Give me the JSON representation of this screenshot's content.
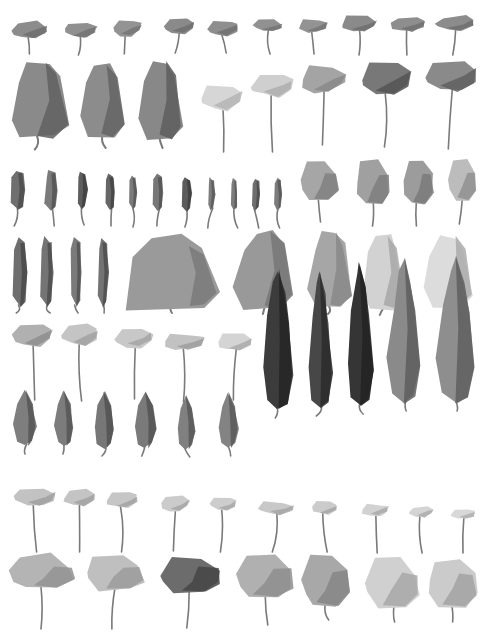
{
  "title": "",
  "background": "#ffffff",
  "trunk_color": "#7a7a7a",
  "rows": [
    {
      "name": "row-1-small-flat-canopy",
      "kind": "flat",
      "trees": [
        {
          "x": 30,
          "y": 30,
          "w": 34,
          "h": 16,
          "trunk": 16,
          "fill": "#8c8c8c",
          "shade": "#6f6f6f"
        },
        {
          "x": 80,
          "y": 30,
          "w": 32,
          "h": 14,
          "trunk": 18,
          "fill": "#909090",
          "shade": "#737373"
        },
        {
          "x": 127,
          "y": 28,
          "w": 28,
          "h": 16,
          "trunk": 18,
          "fill": "#939393",
          "shade": "#767676"
        },
        {
          "x": 179,
          "y": 26,
          "w": 30,
          "h": 14,
          "trunk": 20,
          "fill": "#8a8a8a",
          "shade": "#6e6e6e"
        },
        {
          "x": 223,
          "y": 28,
          "w": 30,
          "h": 14,
          "trunk": 18,
          "fill": "#8e8e8e",
          "shade": "#707070"
        },
        {
          "x": 268,
          "y": 26,
          "w": 28,
          "h": 12,
          "trunk": 22,
          "fill": "#919191",
          "shade": "#747474"
        },
        {
          "x": 313,
          "y": 26,
          "w": 28,
          "h": 12,
          "trunk": 22,
          "fill": "#939393",
          "shade": "#767676"
        },
        {
          "x": 359,
          "y": 24,
          "w": 34,
          "h": 14,
          "trunk": 24,
          "fill": "#8a8a8a",
          "shade": "#6d6d6d"
        },
        {
          "x": 408,
          "y": 24,
          "w": 34,
          "h": 14,
          "trunk": 24,
          "fill": "#8e8e8e",
          "shade": "#717171"
        },
        {
          "x": 455,
          "y": 24,
          "w": 38,
          "h": 14,
          "trunk": 24,
          "fill": "#8c8c8c",
          "shade": "#6f6f6f"
        }
      ]
    },
    {
      "name": "row-2-mixed",
      "kind": "mixed",
      "trees": [
        {
          "x": 38,
          "y": 100,
          "w": 58,
          "h": 75,
          "trunk": 12,
          "fill": "#8a8a8a",
          "shade": "#606060",
          "shape": "column"
        },
        {
          "x": 102,
          "y": 100,
          "w": 46,
          "h": 72,
          "trunk": 12,
          "fill": "#8c8c8c",
          "shade": "#646464",
          "shape": "column"
        },
        {
          "x": 160,
          "y": 100,
          "w": 44,
          "h": 76,
          "trunk": 10,
          "fill": "#888888",
          "shade": "#5e5e5e",
          "shape": "column"
        },
        {
          "x": 222,
          "y": 98,
          "w": 40,
          "h": 24,
          "trunk": 42,
          "fill": "#d6d6d6",
          "shade": "#b5b5b5",
          "shape": "flat"
        },
        {
          "x": 272,
          "y": 86,
          "w": 40,
          "h": 20,
          "trunk": 56,
          "fill": "#cfcfcf",
          "shade": "#aeaeae",
          "shape": "flat"
        },
        {
          "x": 323,
          "y": 80,
          "w": 44,
          "h": 26,
          "trunk": 52,
          "fill": "#a4a4a4",
          "shade": "#8a8a8a",
          "shape": "flat"
        },
        {
          "x": 386,
          "y": 80,
          "w": 50,
          "h": 30,
          "trunk": 52,
          "fill": "#787878",
          "shade": "#545454",
          "shape": "flat"
        },
        {
          "x": 451,
          "y": 76,
          "w": 52,
          "h": 30,
          "trunk": 58,
          "fill": "#8a8a8a",
          "shade": "#5f5f5f",
          "shape": "flat"
        }
      ]
    },
    {
      "name": "row-3-narrow-and-round",
      "kind": "mixed",
      "trees": [
        {
          "x": 18,
          "y": 190,
          "w": 14,
          "h": 40,
          "trunk": 16,
          "fill": "#6f6f6f",
          "shade": "#4e4e4e",
          "shape": "narrow"
        },
        {
          "x": 51,
          "y": 190,
          "w": 12,
          "h": 40,
          "trunk": 16,
          "fill": "#7b7b7b",
          "shade": "#555555",
          "shape": "narrow"
        },
        {
          "x": 82,
          "y": 190,
          "w": 10,
          "h": 38,
          "trunk": 16,
          "fill": "#5e5e5e",
          "shade": "#414141",
          "shape": "narrow"
        },
        {
          "x": 110,
          "y": 192,
          "w": 10,
          "h": 36,
          "trunk": 16,
          "fill": "#666666",
          "shade": "#444444",
          "shape": "narrow"
        },
        {
          "x": 133,
          "y": 192,
          "w": 8,
          "h": 34,
          "trunk": 18,
          "fill": "#7a7a7a",
          "shade": "#565656",
          "shape": "narrow"
        },
        {
          "x": 158,
          "y": 192,
          "w": 10,
          "h": 36,
          "trunk": 16,
          "fill": "#777777",
          "shade": "#545454",
          "shape": "narrow"
        },
        {
          "x": 187,
          "y": 194,
          "w": 9,
          "h": 34,
          "trunk": 16,
          "fill": "#5c5c5c",
          "shade": "#3e3e3e",
          "shape": "narrow"
        },
        {
          "x": 211,
          "y": 194,
          "w": 7,
          "h": 32,
          "trunk": 18,
          "fill": "#7e7e7e",
          "shade": "#5a5a5a",
          "shape": "narrow"
        },
        {
          "x": 234,
          "y": 194,
          "w": 7,
          "h": 32,
          "trunk": 18,
          "fill": "#7d7d7d",
          "shade": "#595959",
          "shape": "narrow"
        },
        {
          "x": 256,
          "y": 194,
          "w": 8,
          "h": 32,
          "trunk": 18,
          "fill": "#6e6e6e",
          "shade": "#4b4b4b",
          "shape": "narrow"
        },
        {
          "x": 278,
          "y": 194,
          "w": 7,
          "h": 32,
          "trunk": 18,
          "fill": "#7c7c7c",
          "shade": "#585858",
          "shape": "narrow"
        },
        {
          "x": 320,
          "y": 180,
          "w": 36,
          "h": 40,
          "trunk": 22,
          "fill": "#a6a6a6",
          "shade": "#808080",
          "shape": "round"
        },
        {
          "x": 373,
          "y": 182,
          "w": 34,
          "h": 44,
          "trunk": 22,
          "fill": "#a0a0a0",
          "shade": "#7e7e7e",
          "shape": "round"
        },
        {
          "x": 418,
          "y": 182,
          "w": 30,
          "h": 44,
          "trunk": 22,
          "fill": "#9c9c9c",
          "shade": "#7a7a7a",
          "shape": "round"
        },
        {
          "x": 462,
          "y": 180,
          "w": 28,
          "h": 40,
          "trunk": 24,
          "fill": "#bcbcbc",
          "shade": "#909090",
          "shape": "round"
        }
      ]
    },
    {
      "name": "row-4-tall-narrow-and-large",
      "kind": "mixed",
      "trees": [
        {
          "x": 20,
          "y": 272,
          "w": 14,
          "h": 70,
          "trunk": 6,
          "fill": "#6e6e6e",
          "shade": "#4a4a4a",
          "shape": "narrow"
        },
        {
          "x": 47,
          "y": 272,
          "w": 12,
          "h": 70,
          "trunk": 6,
          "fill": "#747474",
          "shade": "#4e4e4e",
          "shape": "narrow"
        },
        {
          "x": 76,
          "y": 272,
          "w": 11,
          "h": 70,
          "trunk": 6,
          "fill": "#7a7a7a",
          "shade": "#525252",
          "shape": "narrow"
        },
        {
          "x": 103,
          "y": 272,
          "w": 11,
          "h": 70,
          "trunk": 6,
          "fill": "#737373",
          "shade": "#4d4d4d",
          "shape": "narrow"
        },
        {
          "x": 172,
          "y": 270,
          "w": 92,
          "h": 74,
          "trunk": 6,
          "fill": "#9a9a9a",
          "shade": "#7a7a7a",
          "shape": "mound"
        },
        {
          "x": 264,
          "y": 270,
          "w": 60,
          "h": 76,
          "trunk": 6,
          "fill": "#999999",
          "shade": "#777777",
          "shape": "column"
        },
        {
          "x": 330,
          "y": 270,
          "w": 42,
          "h": 76,
          "trunk": 6,
          "fill": "#a6a6a6",
          "shade": "#888888",
          "shape": "column"
        },
        {
          "x": 383,
          "y": 272,
          "w": 42,
          "h": 74,
          "trunk": 6,
          "fill": "#d2d2d2",
          "shade": "#a8a8a8",
          "shape": "column"
        },
        {
          "x": 448,
          "y": 272,
          "w": 50,
          "h": 70,
          "trunk": 6,
          "fill": "#dcdcdc",
          "shade": "#ababab",
          "shape": "column"
        }
      ]
    },
    {
      "name": "row-5-flat-tall-trunk",
      "kind": "flat",
      "trees": [
        {
          "x": 32,
          "y": 335,
          "w": 40,
          "h": 22,
          "trunk": 54,
          "fill": "#b0b0b0",
          "shade": "#8e8e8e"
        },
        {
          "x": 80,
          "y": 335,
          "w": 36,
          "h": 20,
          "trunk": 56,
          "fill": "#c4c4c4",
          "shade": "#a2a2a2"
        },
        {
          "x": 134,
          "y": 338,
          "w": 36,
          "h": 18,
          "trunk": 52,
          "fill": "#c8c8c8",
          "shade": "#a4a4a4"
        },
        {
          "x": 184,
          "y": 342,
          "w": 40,
          "h": 16,
          "trunk": 52,
          "fill": "#c2c2c2",
          "shade": "#9e9e9e"
        },
        {
          "x": 235,
          "y": 342,
          "w": 34,
          "h": 16,
          "trunk": 50,
          "fill": "#d4d4d4",
          "shade": "#aaaaaa"
        }
      ]
    },
    {
      "name": "row-5-cypress",
      "kind": "cypress",
      "trees": [
        {
          "x": 278,
          "y": 340,
          "w": 30,
          "h": 140,
          "trunk": 8,
          "fill": "#3c3c3c",
          "shade": "#252525"
        },
        {
          "x": 320,
          "y": 340,
          "w": 24,
          "h": 136,
          "trunk": 8,
          "fill": "#474747",
          "shade": "#2b2b2b"
        },
        {
          "x": 360,
          "y": 334,
          "w": 26,
          "h": 144,
          "trunk": 8,
          "fill": "#353535",
          "shade": "#222222"
        },
        {
          "x": 404,
          "y": 330,
          "w": 32,
          "h": 146,
          "trunk": 8,
          "fill": "#8a8a8a",
          "shade": "#5d5d5d"
        },
        {
          "x": 456,
          "y": 330,
          "w": 38,
          "h": 146,
          "trunk": 8,
          "fill": "#8e8e8e",
          "shade": "#5f5f5f"
        }
      ]
    },
    {
      "name": "row-6-ovate",
      "kind": "ovate",
      "trees": [
        {
          "x": 25,
          "y": 418,
          "w": 22,
          "h": 56,
          "trunk": 8,
          "fill": "#7e7e7e",
          "shade": "#555555"
        },
        {
          "x": 64,
          "y": 418,
          "w": 18,
          "h": 56,
          "trunk": 8,
          "fill": "#7c7c7c",
          "shade": "#565656"
        },
        {
          "x": 104,
          "y": 420,
          "w": 20,
          "h": 56,
          "trunk": 8,
          "fill": "#777777",
          "shade": "#515151"
        },
        {
          "x": 145,
          "y": 420,
          "w": 22,
          "h": 56,
          "trunk": 8,
          "fill": "#7a7a7a",
          "shade": "#535353"
        },
        {
          "x": 186,
          "y": 422,
          "w": 18,
          "h": 54,
          "trunk": 8,
          "fill": "#808080",
          "shade": "#585858"
        },
        {
          "x": 228,
          "y": 420,
          "w": 20,
          "h": 56,
          "trunk": 8,
          "fill": "#838383",
          "shade": "#5a5a5a"
        }
      ]
    },
    {
      "name": "row-7-small-light-flat",
      "kind": "flat",
      "trees": [
        {
          "x": 35,
          "y": 497,
          "w": 40,
          "h": 18,
          "trunk": 46,
          "fill": "#c2c2c2",
          "shade": "#a0a0a0"
        },
        {
          "x": 79,
          "y": 498,
          "w": 32,
          "h": 16,
          "trunk": 46,
          "fill": "#c4c4c4",
          "shade": "#a2a2a2"
        },
        {
          "x": 122,
          "y": 500,
          "w": 32,
          "h": 16,
          "trunk": 44,
          "fill": "#c6c6c6",
          "shade": "#a2a2a2"
        },
        {
          "x": 175,
          "y": 504,
          "w": 28,
          "h": 14,
          "trunk": 40,
          "fill": "#cbcbcb",
          "shade": "#a6a6a6"
        },
        {
          "x": 223,
          "y": 504,
          "w": 26,
          "h": 12,
          "trunk": 42,
          "fill": "#cdcdcd",
          "shade": "#a8a8a8"
        },
        {
          "x": 276,
          "y": 508,
          "w": 34,
          "h": 12,
          "trunk": 38,
          "fill": "#c8c8c8",
          "shade": "#a4a4a4"
        },
        {
          "x": 324,
          "y": 508,
          "w": 26,
          "h": 12,
          "trunk": 38,
          "fill": "#cbcbcb",
          "shade": "#a6a6a6"
        },
        {
          "x": 375,
          "y": 510,
          "w": 26,
          "h": 10,
          "trunk": 38,
          "fill": "#d2d2d2",
          "shade": "#aaaaaa"
        },
        {
          "x": 421,
          "y": 512,
          "w": 24,
          "h": 10,
          "trunk": 36,
          "fill": "#d4d4d4",
          "shade": "#acacac"
        },
        {
          "x": 463,
          "y": 514,
          "w": 24,
          "h": 10,
          "trunk": 34,
          "fill": "#d8d8d8",
          "shade": "#b0b0b0"
        }
      ]
    },
    {
      "name": "row-8-round-large",
      "kind": "round",
      "trees": [
        {
          "x": 42,
          "y": 572,
          "w": 62,
          "h": 34,
          "trunk": 40,
          "fill": "#b4b4b4",
          "shade": "#939393"
        },
        {
          "x": 114,
          "y": 572,
          "w": 58,
          "h": 34,
          "trunk": 40,
          "fill": "#bfbfbf",
          "shade": "#9b9b9b"
        },
        {
          "x": 190,
          "y": 574,
          "w": 62,
          "h": 36,
          "trunk": 36,
          "fill": "#6c6c6c",
          "shade": "#454545"
        },
        {
          "x": 264,
          "y": 576,
          "w": 56,
          "h": 42,
          "trunk": 28,
          "fill": "#b0b0b0",
          "shade": "#8e8e8e"
        },
        {
          "x": 326,
          "y": 580,
          "w": 48,
          "h": 52,
          "trunk": 14,
          "fill": "#a8a8a8",
          "shade": "#868686"
        },
        {
          "x": 393,
          "y": 582,
          "w": 52,
          "h": 48,
          "trunk": 16,
          "fill": "#d0d0d0",
          "shade": "#a8a8a8"
        },
        {
          "x": 452,
          "y": 582,
          "w": 48,
          "h": 48,
          "trunk": 16,
          "fill": "#cbcbcb",
          "shade": "#a3a3a3"
        }
      ]
    }
  ]
}
